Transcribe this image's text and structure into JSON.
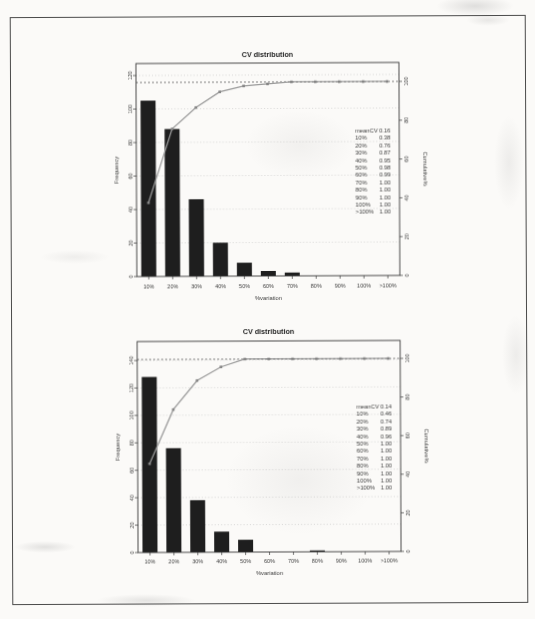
{
  "chart_data": [
    {
      "type": "bar",
      "subtype": "pareto-bar-with-cumulative-line",
      "title": "CV distribution",
      "xlabel": "%variation",
      "ylabel": "Frequency",
      "ylabel_right": "Cumulative%",
      "categories": [
        "10%",
        "20%",
        "30%",
        "40%",
        "50%",
        "60%",
        "70%",
        "80%",
        "90%",
        "100%",
        ">100%"
      ],
      "series": [
        {
          "name": "Frequency",
          "type": "bar",
          "values": [
            105,
            88,
            46,
            20,
            8,
            3,
            2,
            0,
            0,
            0,
            0
          ]
        },
        {
          "name": "Cumulative%",
          "type": "line",
          "values": [
            38,
            76,
            87,
            95,
            98,
            99,
            100,
            100,
            100,
            100,
            100
          ]
        }
      ],
      "ylim": [
        0,
        120
      ],
      "ytick_step": 20,
      "ylim_right": [
        0,
        100
      ],
      "ytick_step_right": 20,
      "grid": "dotted horizontal gridlines, dotted reference line at 100%",
      "legend_position": "inside right",
      "annotation": {
        "header_label": "meanCV",
        "header_value": "0.16",
        "rows": [
          [
            "10%",
            "0.38"
          ],
          [
            "20%",
            "0.76"
          ],
          [
            "30%",
            "0.87"
          ],
          [
            "40%",
            "0.95"
          ],
          [
            "50%",
            "0.98"
          ],
          [
            "60%",
            "0.99"
          ],
          [
            "70%",
            "1.00"
          ],
          [
            "80%",
            "1.00"
          ],
          [
            "90%",
            "1.00"
          ],
          [
            "100%",
            "1.00"
          ],
          [
            ">100%",
            "1.00"
          ]
        ]
      }
    },
    {
      "type": "bar",
      "subtype": "pareto-bar-with-cumulative-line",
      "title": "CV distribution",
      "xlabel": "%variation",
      "ylabel": "Frequency",
      "ylabel_right": "Cumulative%",
      "categories": [
        "10%",
        "20%",
        "30%",
        "40%",
        "50%",
        "60%",
        "70%",
        "80%",
        "90%",
        "100%",
        ">100%"
      ],
      "series": [
        {
          "name": "Frequency",
          "type": "bar",
          "values": [
            128,
            76,
            38,
            15,
            9,
            0,
            0,
            1,
            0,
            0,
            0
          ]
        },
        {
          "name": "Cumulative%",
          "type": "line",
          "values": [
            46,
            74,
            89,
            96,
            100,
            100,
            100,
            100,
            100,
            100,
            100
          ]
        }
      ],
      "ylim": [
        0,
        140
      ],
      "ytick_step": 20,
      "ylim_right": [
        0,
        100
      ],
      "ytick_step_right": 20,
      "grid": "dotted horizontal gridlines, dotted reference line at 100%",
      "legend_position": "inside right",
      "annotation": {
        "header_label": "meanCV",
        "header_value": "0.14",
        "rows": [
          [
            "10%",
            "0.46"
          ],
          [
            "20%",
            "0.74"
          ],
          [
            "30%",
            "0.89"
          ],
          [
            "40%",
            "0.96"
          ],
          [
            "50%",
            "1.00"
          ],
          [
            "60%",
            "1.00"
          ],
          [
            "70%",
            "1.00"
          ],
          [
            "80%",
            "1.00"
          ],
          [
            "90%",
            "1.00"
          ],
          [
            "100%",
            "1.00"
          ],
          [
            ">100%",
            "1.00"
          ]
        ]
      }
    }
  ],
  "colors": {
    "bar": "#1e1e1e",
    "cumulative_line": "#9a9a9a",
    "marker": "#868686",
    "grid": "#bcbcbc",
    "reference_line": "#6a6a6a",
    "axis": "#383838",
    "text": "#3d3d3d",
    "title_text": "#262626",
    "page_background": "#fbfaf8",
    "frame_border": "#4a4a4a"
  }
}
